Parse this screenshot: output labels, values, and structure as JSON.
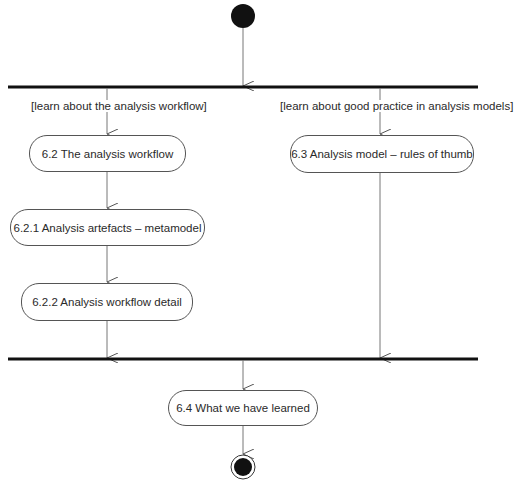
{
  "diagram": {
    "type": "UML activity diagram",
    "start_node": "initial-node",
    "fork": {
      "label": "fork-bar"
    },
    "join": {
      "label": "join-bar"
    },
    "guards": {
      "left": "[learn about the analysis workflow]",
      "right": "[learn about good practice in analysis models]"
    },
    "activities": {
      "a62": "6.2 The analysis workflow",
      "a621": "6.2.1 Analysis artefacts – metamodel",
      "a622": "6.2.2 Analysis workflow detail",
      "a63": "6.3 Analysis model – rules of thumb",
      "a64": "6.4 What we have learned"
    },
    "end_node": "final-node",
    "colors": {
      "line": "#777777",
      "bar": "#111111",
      "node_border": "#555555",
      "text": "#2a2a2a"
    }
  }
}
